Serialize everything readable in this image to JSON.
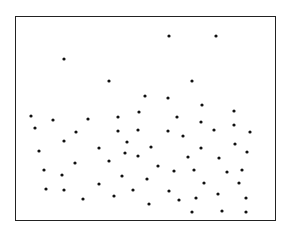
{
  "chart_data": {
    "type": "scatter",
    "title": "",
    "xlabel": "",
    "ylabel": "",
    "grid": false,
    "legend": null,
    "axes_visible": false,
    "frame": {
      "left": 15,
      "top": 16,
      "right": 276,
      "bottom": 221
    },
    "point_color": "#111111",
    "point_radius": 1.6,
    "coordinate_space": "pixel",
    "points": [
      [
        169,
        36
      ],
      [
        216,
        36
      ],
      [
        64,
        59
      ],
      [
        109,
        81
      ],
      [
        192,
        81
      ],
      [
        145,
        96
      ],
      [
        168,
        98
      ],
      [
        202,
        105
      ],
      [
        139,
        112
      ],
      [
        234,
        111
      ],
      [
        31,
        116
      ],
      [
        53,
        120
      ],
      [
        88,
        119
      ],
      [
        118,
        117
      ],
      [
        177,
        117
      ],
      [
        201,
        122
      ],
      [
        234,
        125
      ],
      [
        35,
        128
      ],
      [
        76,
        132
      ],
      [
        118,
        131
      ],
      [
        138,
        130
      ],
      [
        168,
        131
      ],
      [
        214,
        130
      ],
      [
        250,
        132
      ],
      [
        64,
        141
      ],
      [
        127,
        142
      ],
      [
        183,
        136
      ],
      [
        235,
        144
      ],
      [
        39,
        151
      ],
      [
        99,
        148
      ],
      [
        151,
        147
      ],
      [
        201,
        148
      ],
      [
        125,
        153
      ],
      [
        138,
        156
      ],
      [
        188,
        157
      ],
      [
        219,
        158
      ],
      [
        247,
        152
      ],
      [
        109,
        161
      ],
      [
        75,
        163
      ],
      [
        158,
        166
      ],
      [
        44,
        170
      ],
      [
        62,
        175
      ],
      [
        174,
        171
      ],
      [
        194,
        170
      ],
      [
        227,
        172
      ],
      [
        242,
        170
      ],
      [
        122,
        176
      ],
      [
        147,
        179
      ],
      [
        99,
        184
      ],
      [
        204,
        183
      ],
      [
        239,
        183
      ],
      [
        46,
        189
      ],
      [
        64,
        190
      ],
      [
        133,
        190
      ],
      [
        169,
        191
      ],
      [
        218,
        194
      ],
      [
        83,
        199
      ],
      [
        114,
        196
      ],
      [
        179,
        200
      ],
      [
        196,
        198
      ],
      [
        246,
        198
      ],
      [
        149,
        204
      ],
      [
        192,
        212
      ],
      [
        222,
        211
      ],
      [
        246,
        212
      ]
    ]
  }
}
